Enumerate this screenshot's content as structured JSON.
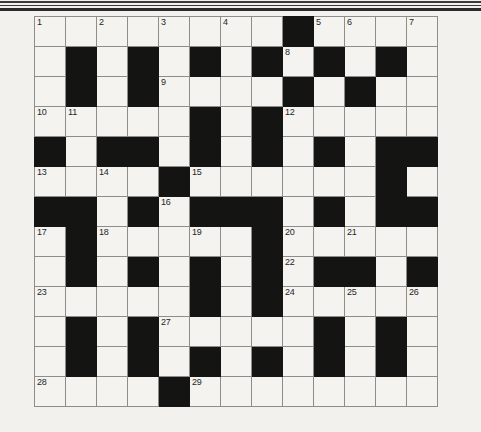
{
  "page": {
    "background_color": "#f2f1ee",
    "rules": [
      {
        "name": "top-rule-1"
      },
      {
        "name": "top-rule-2"
      },
      {
        "name": "top-rule-3"
      }
    ]
  },
  "grid": {
    "rows": 13,
    "columns": 13,
    "cell_color": "#f4f3f0",
    "block_color": "#141412",
    "line_color": "#8d8d8a",
    "border_color": "#4a4a48",
    "legend": {
      "0": "white-cell",
      "1": "black-cell"
    },
    "cells": [
      [
        0,
        0,
        0,
        0,
        0,
        0,
        0,
        0,
        1,
        0,
        0,
        0,
        0
      ],
      [
        0,
        1,
        0,
        1,
        0,
        1,
        0,
        1,
        0,
        1,
        0,
        1,
        0
      ],
      [
        0,
        1,
        0,
        1,
        0,
        0,
        0,
        0,
        1,
        0,
        1,
        0,
        0
      ],
      [
        0,
        0,
        0,
        0,
        0,
        1,
        0,
        1,
        0,
        0,
        0,
        0,
        0
      ],
      [
        1,
        0,
        1,
        1,
        0,
        1,
        0,
        1,
        0,
        1,
        0,
        1,
        1
      ],
      [
        0,
        0,
        0,
        0,
        1,
        0,
        0,
        0,
        0,
        0,
        0,
        1,
        0
      ],
      [
        1,
        1,
        0,
        1,
        0,
        1,
        1,
        1,
        0,
        1,
        0,
        1,
        1
      ],
      [
        0,
        1,
        0,
        0,
        0,
        0,
        0,
        1,
        0,
        0,
        0,
        0,
        0
      ],
      [
        0,
        1,
        0,
        1,
        0,
        1,
        0,
        1,
        0,
        1,
        1,
        0,
        1
      ],
      [
        0,
        0,
        0,
        0,
        0,
        1,
        0,
        1,
        0,
        0,
        0,
        0,
        0
      ],
      [
        0,
        1,
        0,
        1,
        0,
        0,
        0,
        0,
        0,
        1,
        0,
        1,
        0
      ],
      [
        0,
        1,
        0,
        1,
        0,
        1,
        0,
        1,
        0,
        1,
        0,
        1,
        0
      ],
      [
        0,
        0,
        0,
        0,
        1,
        0,
        0,
        0,
        0,
        0,
        0,
        0,
        0
      ]
    ],
    "numbers": [
      {
        "number": "1",
        "row": 0,
        "col": 0
      },
      {
        "number": "2",
        "row": 0,
        "col": 2
      },
      {
        "number": "3",
        "row": 0,
        "col": 4
      },
      {
        "number": "4",
        "row": 0,
        "col": 6
      },
      {
        "number": "5",
        "row": 0,
        "col": 9
      },
      {
        "number": "6",
        "row": 0,
        "col": 10
      },
      {
        "number": "7",
        "row": 0,
        "col": 12
      },
      {
        "number": "8",
        "row": 1,
        "col": 8
      },
      {
        "number": "9",
        "row": 2,
        "col": 4
      },
      {
        "number": "10",
        "row": 3,
        "col": 0
      },
      {
        "number": "11",
        "row": 3,
        "col": 1
      },
      {
        "number": "12",
        "row": 3,
        "col": 8
      },
      {
        "number": "13",
        "row": 5,
        "col": 0
      },
      {
        "number": "14",
        "row": 5,
        "col": 2
      },
      {
        "number": "15",
        "row": 5,
        "col": 5
      },
      {
        "number": "16",
        "row": 6,
        "col": 4
      },
      {
        "number": "17",
        "row": 7,
        "col": 0
      },
      {
        "number": "18",
        "row": 7,
        "col": 2
      },
      {
        "number": "19",
        "row": 7,
        "col": 5
      },
      {
        "number": "20",
        "row": 7,
        "col": 8
      },
      {
        "number": "21",
        "row": 7,
        "col": 10
      },
      {
        "number": "22",
        "row": 8,
        "col": 8
      },
      {
        "number": "23",
        "row": 9,
        "col": 0
      },
      {
        "number": "24",
        "row": 9,
        "col": 8
      },
      {
        "number": "25",
        "row": 9,
        "col": 10
      },
      {
        "number": "26",
        "row": 9,
        "col": 12
      },
      {
        "number": "27",
        "row": 10,
        "col": 4
      },
      {
        "number": "28",
        "row": 12,
        "col": 0
      },
      {
        "number": "29",
        "row": 12,
        "col": 5
      }
    ]
  }
}
